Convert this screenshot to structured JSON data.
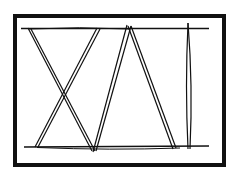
{
  "diagram": {
    "stroke_color": "#111111",
    "background": "#ffffff",
    "frame": {
      "x": 15,
      "y": 16,
      "width": 209,
      "height": 149,
      "stroke_width": 4
    },
    "rails": [
      {
        "name": "top-rail",
        "x1": 21,
        "y1": 29,
        "x2": 209,
        "y2": 29
      },
      {
        "name": "bottom-rail",
        "x1": 24,
        "y1": 147,
        "x2": 209,
        "y2": 147
      }
    ],
    "struts": [
      {
        "name": "strut-1",
        "x1": 29,
        "y1": 28,
        "x2": 94,
        "y2": 151
      },
      {
        "name": "strut-2",
        "x1": 99,
        "y1": 28,
        "x2": 37,
        "y2": 147
      },
      {
        "name": "strut-3",
        "x1": 94,
        "y1": 151,
        "x2": 129,
        "y2": 26
      },
      {
        "name": "strut-4",
        "x1": 129,
        "y1": 26,
        "x2": 175,
        "y2": 149
      },
      {
        "name": "strut-5",
        "x1": 188,
        "y1": 24,
        "x2": 189,
        "y2": 149
      }
    ]
  }
}
